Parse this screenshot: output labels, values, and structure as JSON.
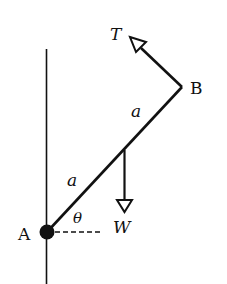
{
  "diagram": {
    "labels": {
      "point_a": "A",
      "point_b": "B",
      "tension": "T",
      "weight": "W",
      "half_length_upper": "a",
      "half_length_lower": "a",
      "angle": "θ"
    },
    "colors": {
      "ink": "#111111",
      "background": "#ffffff"
    }
  }
}
